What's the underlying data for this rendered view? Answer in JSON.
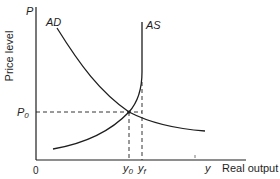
{
  "diagram": {
    "type": "AD-AS macroeconomic equilibrium diagram",
    "colors": {
      "background": "#ffffff",
      "ink": "#1e1e1e"
    },
    "axes": {
      "y_axis_symbol": "P",
      "y_axis_label": "Price level",
      "x_axis_symbol": "y",
      "x_axis_label": "Real output",
      "origin_label": "0"
    },
    "curves": {
      "ad_label": "AD",
      "as_label": "AS"
    },
    "equilibrium": {
      "price_label_base": "P",
      "price_label_sub": "0",
      "output_label_base": "y",
      "output_label_sub": "0"
    },
    "full_employment": {
      "output_label_base": "y",
      "output_label_sub": "f"
    }
  }
}
